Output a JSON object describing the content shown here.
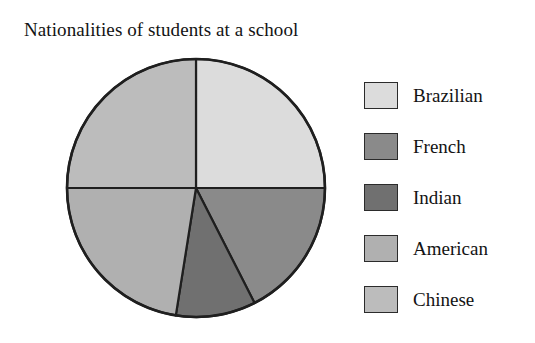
{
  "chart_data": {
    "type": "pie",
    "title": "Nationalities of students at a school",
    "xlabel": "",
    "ylabel": "",
    "legend_position": "right",
    "grid": false,
    "start_angle_deg": 0,
    "direction": "clockwise",
    "categories": [
      "Brazilian",
      "French",
      "Indian",
      "American",
      "Chinese"
    ],
    "values": [
      25,
      17.5,
      10,
      22.5,
      25
    ],
    "unit": "percent",
    "slice_angles_deg": [
      90,
      63,
      36,
      81,
      90
    ],
    "colors": [
      "#dcdcdc",
      "#8a8a8a",
      "#707070",
      "#b0b0b0",
      "#bcbcbc"
    ],
    "slice_order_from_top_clockwise": [
      "Brazilian",
      "French",
      "Indian",
      "American",
      "Chinese"
    ],
    "outline_color": "#1f1f1f",
    "background": "#ffffff",
    "center": {
      "x": 136,
      "y": 135
    },
    "radius": 129
  },
  "legend": {
    "items": [
      {
        "label": "Brazilian",
        "color": "#dcdcdc",
        "swatch_name": "legend-swatch-brazilian"
      },
      {
        "label": "French",
        "color": "#8a8a8a",
        "swatch_name": "legend-swatch-french"
      },
      {
        "label": "Indian",
        "color": "#707070",
        "swatch_name": "legend-swatch-indian"
      },
      {
        "label": "American",
        "color": "#b0b0b0",
        "swatch_name": "legend-swatch-american"
      },
      {
        "label": "Chinese",
        "color": "#bcbcbc",
        "swatch_name": "legend-swatch-chinese"
      }
    ]
  }
}
